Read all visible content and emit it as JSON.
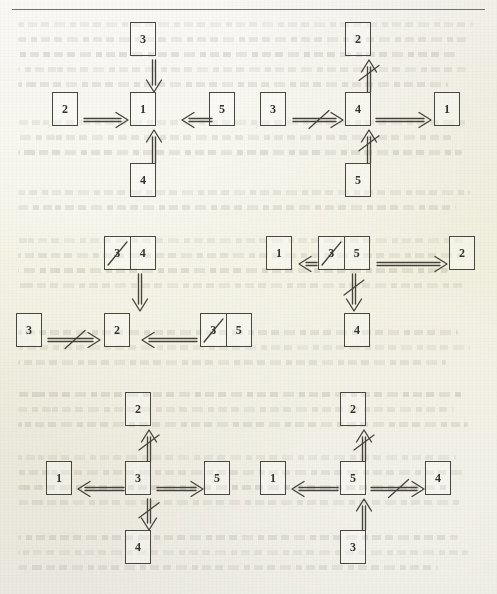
{
  "page": {
    "kind": "scanned-book-page-diagram",
    "ink_color": "#45423b",
    "paper_color": "#eeece6",
    "has_top_rule": true
  },
  "legend": {
    "arrow_right": "⇒",
    "arrow_left": "⇐",
    "arrow_up": "⇑",
    "arrow_down": "⇓",
    "arrow_right_negated": "⇏",
    "arrow_left_negated": "⇍",
    "arrow_up_negated": "⇑̸",
    "arrow_down_negated": "⇓̸",
    "struck_digit": "3"
  },
  "groups": [
    {
      "name": "group-top-left",
      "boxes": [
        {
          "name": "box-top",
          "label": "3"
        },
        {
          "name": "box-left",
          "label": "2"
        },
        {
          "name": "box-center",
          "label": "1"
        },
        {
          "name": "box-right",
          "label": "5"
        },
        {
          "name": "box-bottom",
          "label": "4"
        }
      ],
      "arrows": [
        {
          "name": "arrow-3-to-1",
          "dir": "down",
          "negated": false
        },
        {
          "name": "arrow-2-to-1",
          "dir": "right",
          "negated": false
        },
        {
          "name": "arrow-5-to-1",
          "dir": "left",
          "negated": false
        },
        {
          "name": "arrow-4-to-1",
          "dir": "up",
          "negated": false
        }
      ]
    },
    {
      "name": "group-top-right",
      "boxes": [
        {
          "name": "box-top",
          "label": "2"
        },
        {
          "name": "box-left",
          "label": "3"
        },
        {
          "name": "box-center",
          "label": "4"
        },
        {
          "name": "box-right",
          "label": "1"
        },
        {
          "name": "box-bottom",
          "label": "5"
        }
      ],
      "arrows": [
        {
          "name": "arrow-4-to-2",
          "dir": "up",
          "negated": true
        },
        {
          "name": "arrow-3-to-4",
          "dir": "right",
          "negated": true
        },
        {
          "name": "arrow-4-to-1",
          "dir": "right",
          "negated": false
        },
        {
          "name": "arrow-5-to-4",
          "dir": "up",
          "negated": true
        }
      ]
    },
    {
      "name": "group-middle-left",
      "boxes": [
        {
          "name": "box-top",
          "label": "4",
          "struck_cell": "3"
        },
        {
          "name": "box-left",
          "label": "3"
        },
        {
          "name": "box-center",
          "label": "2"
        },
        {
          "name": "box-right",
          "label": "5",
          "struck_cell": "3"
        }
      ],
      "arrows": [
        {
          "name": "arrow-top-to-2",
          "dir": "down",
          "negated": false
        },
        {
          "name": "arrow-3-to-2",
          "dir": "right",
          "negated": true
        },
        {
          "name": "arrow-right-to-2",
          "dir": "left",
          "negated": false
        }
      ]
    },
    {
      "name": "group-middle-right",
      "boxes": [
        {
          "name": "box-left",
          "label": "1"
        },
        {
          "name": "box-center",
          "label": "5",
          "struck_cell": "3"
        },
        {
          "name": "box-right",
          "label": "2"
        },
        {
          "name": "box-bottom",
          "label": "4"
        }
      ],
      "arrows": [
        {
          "name": "arrow-center-to-1",
          "dir": "left",
          "negated": false
        },
        {
          "name": "arrow-center-to-2",
          "dir": "right",
          "negated": false
        },
        {
          "name": "arrow-center-to-4",
          "dir": "down",
          "negated": true
        }
      ]
    },
    {
      "name": "group-bottom-left",
      "boxes": [
        {
          "name": "box-top",
          "label": "2"
        },
        {
          "name": "box-left",
          "label": "1"
        },
        {
          "name": "box-center",
          "label": "3"
        },
        {
          "name": "box-right",
          "label": "5"
        },
        {
          "name": "box-bottom",
          "label": "4"
        }
      ],
      "arrows": [
        {
          "name": "arrow-3-to-2",
          "dir": "up",
          "negated": true
        },
        {
          "name": "arrow-3-to-1",
          "dir": "left",
          "negated": false
        },
        {
          "name": "arrow-3-to-5",
          "dir": "right",
          "negated": false
        },
        {
          "name": "arrow-3-to-4",
          "dir": "down",
          "negated": true
        }
      ]
    },
    {
      "name": "group-bottom-right",
      "boxes": [
        {
          "name": "box-top",
          "label": "2"
        },
        {
          "name": "box-left",
          "label": "1"
        },
        {
          "name": "box-center",
          "label": "5"
        },
        {
          "name": "box-right",
          "label": "4"
        },
        {
          "name": "box-bottom",
          "label": "3"
        }
      ],
      "arrows": [
        {
          "name": "arrow-5-to-2",
          "dir": "up",
          "negated": true
        },
        {
          "name": "arrow-5-to-1",
          "dir": "left",
          "negated": false
        },
        {
          "name": "arrow-5-to-4",
          "dir": "right",
          "negated": true
        },
        {
          "name": "arrow-3-to-5",
          "dir": "up",
          "negated": false
        }
      ]
    }
  ]
}
